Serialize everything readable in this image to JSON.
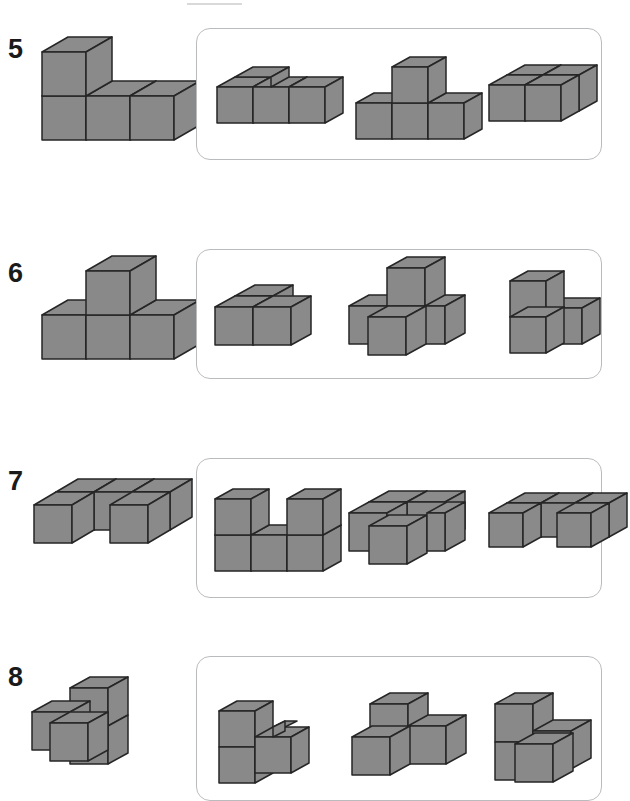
{
  "worksheet": {
    "title": "Cube Figure Matching Worksheet",
    "page_type": "spatial-reasoning-exercise",
    "colors": {
      "cube_top": "#8c8c8c",
      "cube_left": "#898989",
      "cube_right": "#8a8a8a",
      "cube_edge": "#262626",
      "box_border": "#b9bcbe",
      "number_text": "#1a1a1a",
      "background": "#ffffff"
    },
    "rows": [
      {
        "number": "5",
        "prompt": {
          "name": "L-shaped figure: row of three cubes with one cube stacked on the left end",
          "cube_count": 4
        },
        "options": [
          {
            "label": "A",
            "name": "row of three cubes with one cube stacked on the far left rear",
            "cube_count": 4
          },
          {
            "label": "B",
            "name": "row of three cubes with one cube stacked on the middle",
            "cube_count": 4
          },
          {
            "label": "C",
            "name": "two cubes side by side with one cube offset behind right",
            "cube_count": 4
          }
        ]
      },
      {
        "number": "6",
        "prompt": {
          "name": "T-shaped figure: row of three cubes with one cube stacked on the middle",
          "cube_count": 4
        },
        "options": [
          {
            "label": "A",
            "name": "two cubes in front with one cube offset behind",
            "cube_count": 4
          },
          {
            "label": "B",
            "name": "cross-like arrangement of four cubes with one raised",
            "cube_count": 4
          },
          {
            "label": "C",
            "name": "tall cube with two cubes stepping down to the right",
            "cube_count": 4
          }
        ]
      },
      {
        "number": "7",
        "prompt": {
          "name": "U-shaped flat figure: four cubes in a row with a gap notch in front",
          "cube_count": 5
        },
        "options": [
          {
            "label": "A",
            "name": "U-shaped wall: two upright columns joined by a bottom row",
            "cube_count": 5
          },
          {
            "label": "B",
            "name": "2x2 block of cubes with one cube protruding in front",
            "cube_count": 5
          },
          {
            "label": "C",
            "name": "flat row of cubes with a notch gap on the front face",
            "cube_count": 5
          }
        ]
      },
      {
        "number": "8",
        "prompt": {
          "name": "step figure: tall cube at back right with two cubes in front lower level",
          "cube_count": 4
        },
        "options": [
          {
            "label": "A",
            "name": "tall cube on the left with step down to two cubes on the right",
            "cube_count": 4
          },
          {
            "label": "B",
            "name": "upper cube with two cubes splayed below left and right",
            "cube_count": 4
          },
          {
            "label": "C",
            "name": "tall cube with a cube behind right and a cube in front",
            "cube_count": 4
          }
        ]
      }
    ]
  }
}
